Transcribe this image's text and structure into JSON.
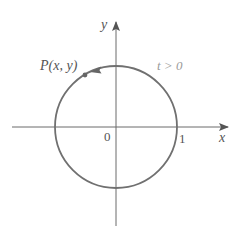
{
  "diagram": {
    "type": "unit-circle-parametric",
    "colors": {
      "axis": "#6b6b6b",
      "circle": "#707070",
      "label": "#555555",
      "annotation": "#9a9a9a",
      "background": "#ffffff"
    },
    "axes": {
      "x_label": "x",
      "y_label": "y",
      "origin_label": "0",
      "x_tick_label": "1"
    },
    "circle": {
      "center": [
        0,
        0
      ],
      "radius": 1
    },
    "point": {
      "label": "P(x, y)"
    },
    "direction": {
      "label": "t > 0",
      "orientation": "counterclockwise"
    }
  }
}
